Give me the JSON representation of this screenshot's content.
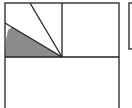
{
  "diagram": {
    "type": "geometry-figure",
    "colors": {
      "stroke": "#222222",
      "shade": "#8c8c8c",
      "background": "#ffffff"
    },
    "shapes": {
      "outer_square": {
        "x": 5,
        "y": 3,
        "w": 114,
        "h": 114
      },
      "divider_horizontal_y": 57,
      "divider_vertical_x": 62,
      "segment_a": {
        "x1": 62,
        "y1": 57,
        "x2": 30,
        "y2": 3
      },
      "segment_b": {
        "x1": 62,
        "y1": 57,
        "x2": 5,
        "y2": 23
      },
      "shaded_region": "5,57 62,57 12,27 8,30 6,40",
      "right_partial_shape": {
        "x": 129,
        "y": 3,
        "w": 10,
        "h": 46
      }
    }
  }
}
